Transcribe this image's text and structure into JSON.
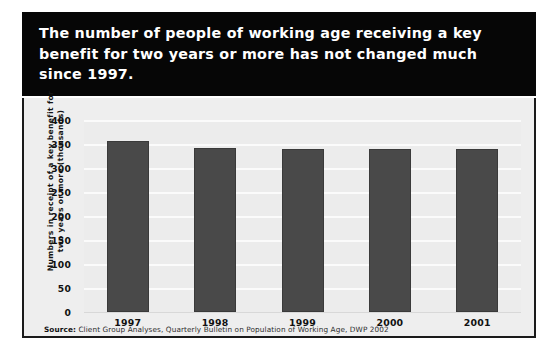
{
  "title": {
    "text": "The number of people of working age receiving a key benefit for two years or more has not changed much since 1997."
  },
  "source": {
    "label": "Source:",
    "text": " Client Group Analyses, Quarterly Bulletin on Population of Working Age, DWP 2002"
  },
  "colors": {
    "banner_background": "#060606",
    "banner_text": "#ffffff",
    "panel_background": "#eeeeee",
    "plot_background": "#ececec",
    "bar": "#494949",
    "gridline": "#fbfbfb",
    "border": "#1a1a1a"
  },
  "chart_data": {
    "type": "bar",
    "title": "The number of people of working age receiving a key benefit for two years or more has not changed much since 1997.",
    "categories": [
      "1997",
      "1998",
      "1999",
      "2000",
      "2001"
    ],
    "values": [
      357,
      342,
      340,
      340,
      340
    ],
    "series": [
      {
        "name": "Numbers in receipt of a key benefit for two years or more (thousands)",
        "values": [
          357,
          342,
          340,
          340,
          340
        ]
      }
    ],
    "xlabel": "",
    "ylabel": "Numbers in receipt of a key benefit for two years or more (thousands)",
    "ylabel_line1": "Numbers in receipt of a key benefit for",
    "ylabel_line2": "two years or more (thousands)",
    "ylim": [
      0,
      400
    ],
    "yticks": [
      0,
      50,
      100,
      150,
      200,
      250,
      300,
      350,
      400
    ],
    "ytick_labels": [
      "0",
      "50",
      "100",
      "150",
      "200",
      "250",
      "300",
      "350",
      "400"
    ],
    "grid": true,
    "legend": false,
    "units": "thousands",
    "source": "Source: Client Group Analyses, Quarterly Bulletin on Population of Working Age, DWP 2002"
  }
}
